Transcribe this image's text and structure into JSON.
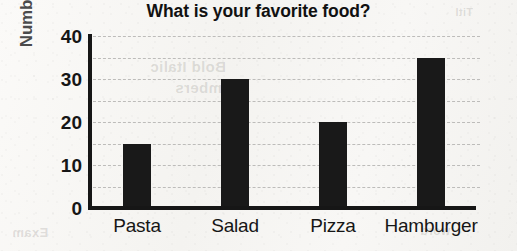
{
  "chart_data": {
    "type": "bar",
    "title": "What is your favorite food?",
    "xlabel": "",
    "ylabel": "Number of People",
    "categories": [
      "Pasta",
      "Salad",
      "Pizza",
      "Hamburger"
    ],
    "values": [
      15,
      30,
      20,
      35
    ],
    "ylim": [
      0,
      40
    ],
    "ytick_labels": [
      "40",
      "30",
      "20",
      "10",
      "0"
    ],
    "ytick_values": [
      40,
      30,
      20,
      10,
      0
    ],
    "gridline_values": [
      40,
      35,
      30,
      25,
      20,
      15,
      10,
      5
    ],
    "grid": true,
    "legend": "none",
    "bar_color": "#191919",
    "gridline_color": "#bdbcba",
    "axis_color": "#161616",
    "ylabel_color": "#4b4b4b"
  },
  "background": {
    "bleed_through_text": [
      "Bold Italic",
      "numbers",
      "Titl",
      "Exam",
      "word"
    ]
  }
}
